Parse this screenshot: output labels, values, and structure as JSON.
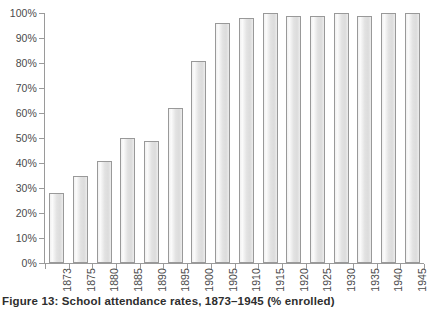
{
  "caption": "Figure 13: School attendance rates, 1873–1945 (% enrolled)",
  "chart_data": {
    "type": "bar",
    "title": "Figure 13: School attendance rates, 1873–1945 (% enrolled)",
    "xlabel": "",
    "ylabel": "",
    "ylim": [
      0,
      100
    ],
    "ytick_labels": [
      "0%",
      "10%",
      "20%",
      "30%",
      "40%",
      "50%",
      "60%",
      "70%",
      "80%",
      "90%",
      "100%"
    ],
    "ytick_values": [
      0,
      10,
      20,
      30,
      40,
      50,
      60,
      70,
      80,
      90,
      100
    ],
    "grid": false,
    "legend": false,
    "bar_color": "#e8e8e8",
    "bar_border_color": "#999999",
    "axis_color": "#9a9a9a",
    "categories": [
      "1873",
      "1875",
      "1880",
      "1885",
      "1890",
      "1895",
      "1900",
      "1905",
      "1910",
      "1915",
      "1920",
      "1925",
      "1930",
      "1935",
      "1940",
      "1945"
    ],
    "values": [
      28,
      35,
      41,
      50,
      49,
      62,
      81,
      96,
      98,
      100,
      99,
      99,
      100,
      99,
      100,
      100
    ]
  }
}
